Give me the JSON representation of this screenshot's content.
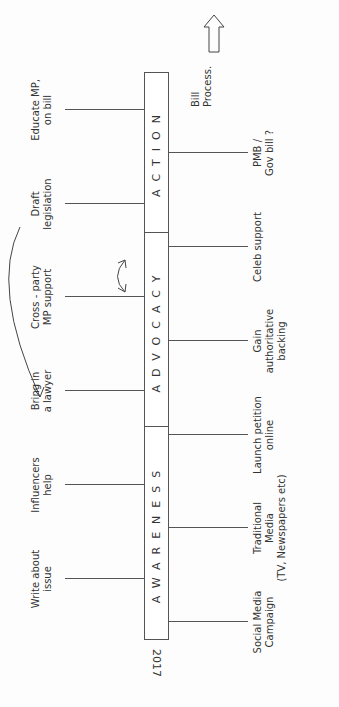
{
  "diagram": {
    "year": "2017",
    "phases": [
      {
        "name": "AWARENESS"
      },
      {
        "name": "ADVOCACY"
      },
      {
        "name": "ACTION"
      }
    ],
    "top_items": [
      {
        "text": "Write about issue",
        "lines": [
          "Write about",
          "issue"
        ]
      },
      {
        "text": "Influencers help",
        "lines": [
          "Influencers",
          "help"
        ]
      },
      {
        "text": "Bring in a lawyer",
        "lines": [
          "Bring in",
          "a lawyer"
        ]
      },
      {
        "text": "Cross-party MP support",
        "lines": [
          "Cross - party",
          "MP support"
        ]
      },
      {
        "text": "Draft legislation",
        "lines": [
          "Draft",
          "legislation"
        ]
      },
      {
        "text": "Educate MP, on bill",
        "lines": [
          "Educate MP,",
          "on bill"
        ]
      }
    ],
    "bottom_items": [
      {
        "text": "Social Media Campaign",
        "lines": [
          "Social Media",
          "Campaign"
        ]
      },
      {
        "text": "Traditional Media (TV, Newspapers etc)",
        "lines": [
          "Traditional",
          "Media",
          "(TV, Newspapers etc)"
        ]
      },
      {
        "text": "Launch petition online",
        "lines": [
          "Launch petition",
          "online"
        ]
      },
      {
        "text": "Gain authoritative backing",
        "lines": [
          "Gain",
          "authoritative",
          "backing"
        ]
      },
      {
        "text": "Celeb support",
        "lines": [
          "Celeb support"
        ]
      },
      {
        "text": "PMB / Gov bill?",
        "lines": [
          "PMB /",
          "Gov bill ?"
        ]
      }
    ],
    "end_note": {
      "lines": [
        "Bill",
        "Process."
      ]
    },
    "colors": {
      "ink": "#333333",
      "paper": "#fdfdfd"
    }
  }
}
